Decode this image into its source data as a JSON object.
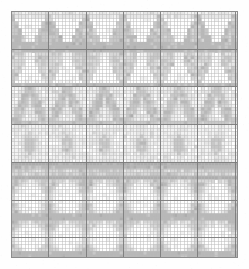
{
  "document": {
    "kind": "pattern-chart",
    "title": "Gridded pattern chart",
    "description": "Faded scanned squared-paper chart filled with a repeating geometric motif",
    "background_color": "#ffffff",
    "paper_color": "#fefefe"
  },
  "grid": {
    "x": 11,
    "y": 11,
    "width": 227,
    "height": 247,
    "columns": 67,
    "rows": 72,
    "cell_width": 3.388,
    "cell_height": 3.43,
    "fine_line_color": "#b9b9b9",
    "fine_line_width": 0.5,
    "major_line_color": "#7b7b7b",
    "major_line_width": 0.9,
    "major_every_columns": 11,
    "major_every_rows": 11,
    "border_color": "#8d8d8d"
  },
  "palette": {
    "empty": "#ffffff",
    "light": "#ededed",
    "mid_light": "#dcdcdc",
    "mid": "#c6c6c6",
    "mid_dark": "#b0b0b0",
    "dark": "#9a9a9a",
    "darkest": "#8a8a8a"
  },
  "chart_data": {
    "type": "heatmap",
    "title": "Gridded pattern chart",
    "xlabel": "",
    "ylabel": "",
    "grid": true,
    "legend": "none",
    "columns": 67,
    "rows": 72,
    "value_levels": [
      0,
      1,
      2,
      3,
      4,
      5,
      6
    ],
    "level_colors": [
      "#ffffff",
      "#ededed",
      "#dcdcdc",
      "#c6c6c6",
      "#b0b0b0",
      "#9a9a9a",
      "#8a8a8a"
    ],
    "bands": [
      {
        "name": "band-1-triangles",
        "row_start": 0,
        "row_end": 11,
        "motif": "triangles-with-diamond-voids",
        "repeat_columns": 11,
        "base_level": 4
      },
      {
        "name": "band-2-arches",
        "row_start": 11,
        "row_end": 22,
        "motif": "arches-and-small-diamonds",
        "repeat_columns": 11,
        "base_level": 3
      },
      {
        "name": "band-3-zigzag",
        "row_start": 22,
        "row_end": 33,
        "motif": "zigzag-chevrons",
        "repeat_columns": 11,
        "base_level": 3
      },
      {
        "name": "band-4-open",
        "row_start": 33,
        "row_end": 44,
        "motif": "sparse-dots-open-field",
        "repeat_columns": 11,
        "base_level": 2
      },
      {
        "name": "band-5-divider",
        "row_start": 44,
        "row_end": 49,
        "motif": "solid-divider-rule",
        "repeat_columns": 11,
        "base_level": 5
      },
      {
        "name": "band-6-blobs",
        "row_start": 49,
        "row_end": 61,
        "motif": "rounded-blobs-on-dark-field",
        "repeat_columns": 11,
        "base_level": 4
      },
      {
        "name": "band-7-blobs",
        "row_start": 61,
        "row_end": 72,
        "motif": "rounded-blobs-on-dark-field",
        "repeat_columns": 11,
        "base_level": 4
      }
    ]
  }
}
